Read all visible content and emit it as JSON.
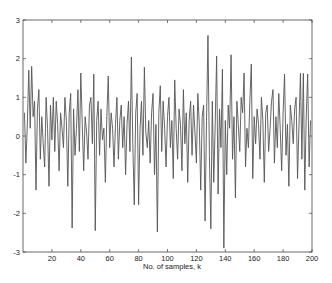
{
  "chart_data": {
    "type": "line",
    "title": "",
    "xlabel": "No. of samples, k",
    "ylabel": "",
    "xlim": [
      0,
      200
    ],
    "ylim": [
      -3,
      3
    ],
    "xticks": [
      20,
      40,
      60,
      80,
      100,
      120,
      140,
      160,
      180,
      200
    ],
    "yticks": [
      -3,
      -2,
      -1,
      0,
      1,
      2,
      3
    ],
    "grid": false,
    "legend": null,
    "line_color": "#555555",
    "series": [
      {
        "name": "signal",
        "x_start": 1,
        "x_step": 1,
        "values": [
          0.6,
          -0.7,
          0.3,
          1.7,
          0.2,
          1.8,
          0.5,
          0.9,
          -1.4,
          0.7,
          1.2,
          -0.6,
          0.5,
          -0.2,
          -0.8,
          1.0,
          0.2,
          -1.3,
          0.8,
          -0.1,
          1.0,
          -0.4,
          0.9,
          0.3,
          -0.9,
          0.6,
          0.2,
          -0.3,
          1.0,
          0.4,
          -1.3,
          0.6,
          1.1,
          -2.38,
          0.7,
          -0.5,
          0.2,
          1.2,
          -0.4,
          1.63,
          0.3,
          -0.9,
          0.5,
          0.1,
          -0.6,
          0.8,
          1.0,
          -0.2,
          1.6,
          -2.45,
          0.4,
          0.9,
          -0.5,
          0.7,
          -0.1,
          0.2,
          -1.2,
          0.5,
          1.55,
          -0.3,
          0.6,
          0.2,
          -0.8,
          0.3,
          1.0,
          -0.6,
          0.4,
          0.8,
          -0.3,
          0.5,
          -1.0,
          0.3,
          0.9,
          -0.4,
          2.04,
          -0.2,
          -1.78,
          0.6,
          1.1,
          -1.78,
          0.2,
          0.9,
          -0.5,
          1.78,
          0.1,
          -0.3,
          0.4,
          -0.7,
          0.6,
          1.1,
          -1.0,
          0.3,
          -2.48,
          0.6,
          1.3,
          -0.4,
          0.9,
          0.2,
          -0.8,
          0.5,
          1.0,
          -0.3,
          0.4,
          -1.1,
          1.45,
          0.2,
          -0.6,
          0.7,
          0.3,
          -0.9,
          1.2,
          -0.2,
          0.6,
          -1.2,
          0.4,
          0.9,
          -0.5,
          0.8,
          0.1,
          -0.7,
          1.1,
          0.3,
          -1.4,
          0.5,
          0.8,
          -2.2,
          0.4,
          2.6,
          -0.5,
          -2.4,
          0.9,
          -1.2,
          0.3,
          2.07,
          -1.5,
          0.7,
          -0.3,
          1.73,
          -2.9,
          0.4,
          -1.0,
          0.8,
          0.2,
          2.1,
          -0.6,
          0.5,
          -1.6,
          0.9,
          0.3,
          -0.4,
          1.0,
          0.6,
          1.63,
          -0.8,
          0.2,
          -0.3,
          0.9,
          1.86,
          -1.1,
          0.5,
          -0.2,
          0.7,
          0.3,
          -0.6,
          1.0,
          0.4,
          -1.2,
          0.6,
          0.8,
          -0.4,
          0.2,
          0.9,
          1.2,
          -0.7,
          0.5,
          -0.3,
          1.1,
          0.2,
          -0.9,
          0.6,
          1.6,
          -0.5,
          0.3,
          -1.3,
          0.8,
          0.4,
          -0.2,
          0.7,
          1.0,
          -1.1,
          0.3,
          1.62,
          -0.6,
          1.62,
          -1.4,
          0.5,
          1.6,
          -0.8,
          0.4
        ]
      }
    ]
  },
  "plot_area": {
    "left": 23,
    "top": 20,
    "right": 312,
    "bottom": 252
  }
}
